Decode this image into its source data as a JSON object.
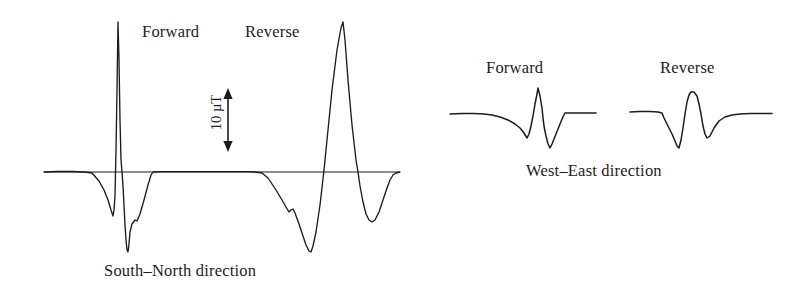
{
  "figure": {
    "background_color": "#ffffff",
    "ink_color": "#1c1c1c",
    "panels": [
      {
        "id": "south-north",
        "caption": "South–North direction",
        "labels": [
          "Forward",
          "Reverse"
        ]
      },
      {
        "id": "west-east",
        "caption": "West–East direction",
        "labels": [
          "Forward",
          "Reverse"
        ]
      }
    ]
  },
  "panel_sn": {
    "caption": "South–North direction",
    "label_forward": "Forward",
    "label_reverse": "Reverse"
  },
  "panel_we": {
    "caption": "West–East direction",
    "label_forward": "Forward",
    "label_reverse": "Reverse"
  },
  "scale_bar": {
    "value": "10",
    "unit": "µT",
    "text": "10 µT",
    "orientation": "vertical-double-arrow",
    "rotation_deg": -90
  },
  "chart_data": {
    "type": "line",
    "title": "",
    "subtitle": "",
    "xlabel": "",
    "ylabel": "",
    "grid": false,
    "legend_position": "inline-annotations",
    "units": {
      "y": "µT"
    },
    "scale_bar_uT": 10,
    "scale_bar_pixels": 50,
    "annotations": [
      {
        "text": "Forward",
        "panel": "south-north",
        "x": 178,
        "y": 33
      },
      {
        "text": "Reverse",
        "panel": "south-north",
        "x": 283,
        "y": 33
      },
      {
        "text": "10 µT",
        "panel": "south-north",
        "x": 215,
        "y": 120,
        "rotated": true
      },
      {
        "text": "South–North direction",
        "panel": "south-north",
        "x": 215,
        "y": 272
      },
      {
        "text": "Forward",
        "panel": "west-east",
        "x": 530,
        "y": 70
      },
      {
        "text": "Reverse",
        "panel": "west-east",
        "x": 703,
        "y": 70
      },
      {
        "text": "West–East direction",
        "panel": "west-east",
        "x": 600,
        "y": 172
      }
    ],
    "series": [
      {
        "name": "South-North direction",
        "panel": "south-north",
        "baseline_y": 172,
        "x_range": [
          44,
          400
        ],
        "points": [
          [
            44,
            172
          ],
          [
            58,
            171.5
          ],
          [
            72,
            171.5
          ],
          [
            84,
            172
          ],
          [
            92,
            173
          ],
          [
            99,
            181
          ],
          [
            104,
            190
          ],
          [
            108,
            200
          ],
          [
            111,
            210
          ],
          [
            113,
            216
          ],
          [
            114,
            210
          ],
          [
            115,
            196
          ],
          [
            116,
            150
          ],
          [
            117,
            90
          ],
          [
            118,
            22
          ],
          [
            119,
            60
          ],
          [
            120,
            120
          ],
          [
            121,
            160
          ],
          [
            122,
            172
          ],
          [
            123,
            186
          ],
          [
            124,
            205
          ],
          [
            125,
            225
          ],
          [
            126,
            240
          ],
          [
            127,
            250
          ],
          [
            128,
            252
          ],
          [
            129,
            244
          ],
          [
            130,
            232
          ],
          [
            132,
            224
          ],
          [
            135,
            220
          ],
          [
            137,
            221
          ],
          [
            140,
            214
          ],
          [
            144,
            200
          ],
          [
            148,
            185
          ],
          [
            151,
            175
          ],
          [
            153,
            172
          ],
          [
            160,
            171.6
          ],
          [
            175,
            171.6
          ],
          [
            195,
            171.6
          ],
          [
            215,
            171.6
          ],
          [
            235,
            171.6
          ],
          [
            248,
            171.6
          ],
          [
            255,
            172
          ],
          [
            262,
            173
          ],
          [
            268,
            178
          ],
          [
            276,
            190
          ],
          [
            282,
            200
          ],
          [
            286,
            207
          ],
          [
            289,
            212
          ],
          [
            291,
            210
          ],
          [
            293,
            209
          ],
          [
            295,
            213
          ],
          [
            299,
            224
          ],
          [
            303,
            236
          ],
          [
            306,
            245
          ],
          [
            309,
            251
          ],
          [
            311,
            252
          ],
          [
            313,
            246
          ],
          [
            316,
            232
          ],
          [
            320,
            205
          ],
          [
            324,
            170
          ],
          [
            328,
            130
          ],
          [
            332,
            90
          ],
          [
            337,
            50
          ],
          [
            341,
            28
          ],
          [
            343,
            22
          ],
          [
            345,
            40
          ],
          [
            348,
            80
          ],
          [
            352,
            125
          ],
          [
            356,
            160
          ],
          [
            358,
            172
          ],
          [
            360,
            186
          ],
          [
            363,
            202
          ],
          [
            366,
            214
          ],
          [
            369,
            220
          ],
          [
            372,
            222
          ],
          [
            375,
            220
          ],
          [
            379,
            212
          ],
          [
            383,
            200
          ],
          [
            387,
            188
          ],
          [
            390,
            180
          ],
          [
            393,
            175
          ],
          [
            396,
            173
          ],
          [
            400,
            172
          ]
        ]
      },
      {
        "name": "West-East direction Forward",
        "panel": "west-east",
        "baseline_y": 114,
        "x_range": [
          450,
          596
        ],
        "points": [
          [
            450,
            114
          ],
          [
            462,
            113.6
          ],
          [
            474,
            113.6
          ],
          [
            484,
            114
          ],
          [
            492,
            115
          ],
          [
            500,
            117
          ],
          [
            508,
            120
          ],
          [
            515,
            124
          ],
          [
            520,
            128
          ],
          [
            524,
            133
          ],
          [
            527,
            138
          ],
          [
            529,
            134
          ],
          [
            531,
            126
          ],
          [
            533,
            116
          ],
          [
            535,
            104
          ],
          [
            537,
            94
          ],
          [
            538,
            88
          ],
          [
            540,
            96
          ],
          [
            542,
            108
          ],
          [
            543,
            118
          ],
          [
            544,
            126
          ],
          [
            546,
            136
          ],
          [
            548,
            144
          ],
          [
            550,
            148
          ],
          [
            552,
            144
          ],
          [
            556,
            134
          ],
          [
            560,
            124
          ],
          [
            563,
            117
          ],
          [
            565,
            113
          ],
          [
            570,
            113
          ],
          [
            580,
            113
          ],
          [
            590,
            113
          ],
          [
            596,
            113
          ]
        ]
      },
      {
        "name": "West-East direction Reverse",
        "panel": "west-east",
        "baseline_y": 114,
        "x_range": [
          630,
          772
        ],
        "points": [
          [
            630,
            112
          ],
          [
            640,
            111.6
          ],
          [
            650,
            111.6
          ],
          [
            658,
            112
          ],
          [
            662,
            113
          ],
          [
            664,
            118
          ],
          [
            668,
            126
          ],
          [
            672,
            134
          ],
          [
            675,
            141
          ],
          [
            677,
            146
          ],
          [
            679,
            148
          ],
          [
            681,
            140
          ],
          [
            683,
            128
          ],
          [
            685,
            114
          ],
          [
            687,
            102
          ],
          [
            689,
            95
          ],
          [
            691,
            92
          ],
          [
            694,
            92
          ],
          [
            697,
            96
          ],
          [
            699,
            104
          ],
          [
            701,
            114
          ],
          [
            703,
            126
          ],
          [
            705,
            134
          ],
          [
            707,
            138
          ],
          [
            710,
            136
          ],
          [
            714,
            128
          ],
          [
            719,
            121
          ],
          [
            725,
            117
          ],
          [
            732,
            115
          ],
          [
            740,
            114
          ],
          [
            750,
            113.6
          ],
          [
            762,
            113.6
          ],
          [
            772,
            113.6
          ]
        ]
      }
    ]
  }
}
